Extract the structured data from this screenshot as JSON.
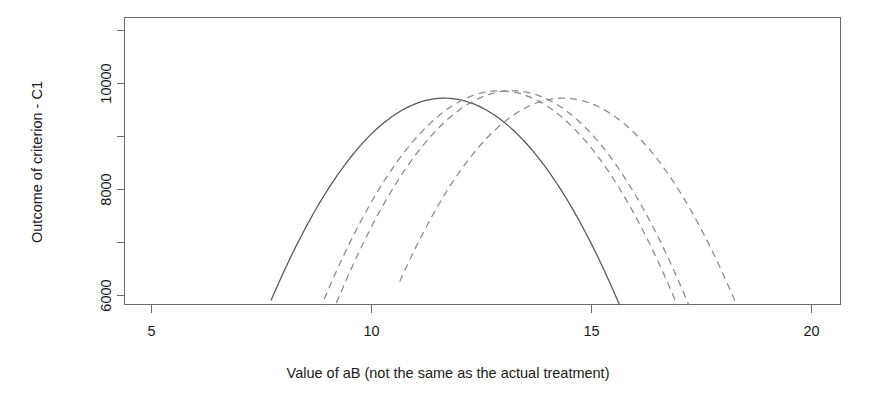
{
  "chart_data": {
    "type": "line",
    "title": "",
    "subtitle": "",
    "xlabel": "Value of aB (not the same as the actual treatment)",
    "ylabel": "Outcome of criterion - C1",
    "xlim": [
      3.8,
      20.7
    ],
    "ylim": [
      5700,
      11520
    ],
    "grid": false,
    "legend": "none",
    "x_ticks": [
      5,
      10,
      15,
      20
    ],
    "x_tick_labels": [
      "5",
      "10",
      "15",
      "20"
    ],
    "y_ticks": [
      6000,
      7000,
      8000,
      9000,
      10000,
      11000
    ],
    "y_tick_labels": [
      "6000",
      "",
      "8000",
      "",
      "10000",
      ""
    ],
    "y_labeled_ticks": [
      6000,
      8000,
      10000
    ],
    "note": "Four concave (inverted-parabola) response curves clipped by the plot frame at the bottom; one solid curve and three dashed curves.",
    "series": [
      {
        "name": "curve-1-solid",
        "style": "solid",
        "color": "#555555",
        "vertex_x": 11.35,
        "vertex_y": 9880,
        "left_root_x": 7.52,
        "right_root_x": 15.55,
        "y_at_left_edge_of_visible": 5930,
        "y_at_right_edge_of_visible": 5930,
        "x": [
          7.52,
          8.0,
          8.5,
          9.0,
          9.5,
          10.0,
          10.5,
          11.0,
          11.35,
          11.75,
          12.25,
          12.75,
          13.25,
          13.75,
          14.25,
          14.75,
          15.2,
          15.55
        ],
        "y": [
          5930,
          6540,
          7110,
          7620,
          8080,
          8480,
          8830,
          9120,
          9880,
          9770,
          9520,
          9180,
          8760,
          8250,
          7660,
          6980,
          6300,
          5930
        ]
      },
      {
        "name": "curve-2-dashed",
        "style": "dashed",
        "color": "#8a8a8a",
        "vertex_x": 12.65,
        "vertex_y": 10030,
        "left_root_x": 8.45,
        "right_root_x": 16.6,
        "x": [
          8.45,
          9.0,
          9.5,
          10.0,
          10.5,
          11.0,
          11.5,
          12.0,
          12.65,
          13.25,
          13.75,
          14.25,
          14.75,
          15.25,
          15.75,
          16.2,
          16.6
        ],
        "y": [
          5930,
          6620,
          7200,
          7720,
          8190,
          8600,
          8950,
          9250,
          10030,
          9900,
          9680,
          9380,
          9000,
          8530,
          7980,
          7350,
          5930
        ]
      },
      {
        "name": "curve-3-dashed",
        "style": "dashed",
        "color": "#8a8a8a",
        "vertex_x": 12.95,
        "vertex_y": 10030,
        "left_root_x": 8.95,
        "right_root_x": 17.05,
        "x": [
          8.95,
          9.5,
          10.0,
          10.5,
          11.0,
          11.5,
          12.0,
          12.5,
          12.95,
          13.5,
          14.0,
          14.5,
          15.0,
          15.5,
          16.0,
          16.5,
          17.05
        ],
        "y": [
          5930,
          6620,
          7200,
          7730,
          8200,
          8610,
          8960,
          9260,
          10030,
          9900,
          9690,
          9400,
          9030,
          8580,
          8050,
          7440,
          5930
        ]
      },
      {
        "name": "curve-4-dashed",
        "style": "dashed",
        "color": "#8a8a8a",
        "vertex_x": 14.15,
        "vertex_y": 9880,
        "left_root_x": 10.55,
        "right_root_x": 18.5,
        "x": [
          10.55,
          11.0,
          11.5,
          12.0,
          12.5,
          13.0,
          13.5,
          14.15,
          14.75,
          15.25,
          15.75,
          16.25,
          16.75,
          17.25,
          17.75,
          18.15,
          18.5
        ],
        "y": [
          5930,
          6490,
          7070,
          7590,
          8060,
          8470,
          8830,
          9880,
          9770,
          9570,
          9320,
          9010,
          8650,
          8230,
          7750,
          7320,
          5930
        ]
      }
    ]
  },
  "axes": {
    "y_title": "Outcome of criterion - C1",
    "x_title": "Value of aB (not the same as the actual treatment)",
    "y_tick_labels": [
      "10000",
      "8000",
      "6000"
    ],
    "x_tick_labels": [
      "5",
      "10",
      "15",
      "20"
    ]
  },
  "colors": {
    "background": "#ffffff",
    "frame": "#6b6b6b",
    "solid_curve": "#555555",
    "dashed_curve": "#8a8a8a",
    "text": "#1a1a1a"
  }
}
